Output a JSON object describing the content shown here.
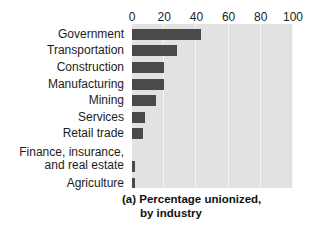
{
  "chart_data": {
    "type": "bar",
    "orientation": "horizontal",
    "title": "(a) Percentage unionized, by industry",
    "title_line1": "(a) Percentage unionized,",
    "title_line2": "by industry",
    "xlabel": "",
    "ylabel": "",
    "xlim": [
      0,
      100
    ],
    "xticks": [
      0,
      20,
      40,
      60,
      80,
      100
    ],
    "xticklabels": [
      "0",
      "20",
      "40",
      "60",
      "80",
      "100"
    ],
    "grid": true,
    "grid_axis": "x",
    "legend": "none",
    "categories": [
      "Government",
      "Transportation",
      "Construction",
      "Manufacturing",
      "Mining",
      "Services",
      "Retail trade",
      "Finance, insurance,\nand real estate",
      "Agriculture"
    ],
    "values": [
      43,
      28,
      20,
      20,
      15,
      8,
      7,
      2,
      1.5
    ],
    "colors": {
      "bar": "#4a4a4a",
      "plot_background": "#e2e2e2",
      "gridline": "#f4f4f4",
      "figure_background": "#ffffff",
      "text": "#1c1c1c"
    }
  },
  "axis": {
    "ticks": [
      {
        "label": "0",
        "value": 0
      },
      {
        "label": "20",
        "value": 20
      },
      {
        "label": "40",
        "value": 40
      },
      {
        "label": "60",
        "value": 60
      },
      {
        "label": "80",
        "value": 80
      },
      {
        "label": "100",
        "value": 100
      }
    ]
  },
  "rows": [
    {
      "label": "Government",
      "value": 43,
      "tall": false
    },
    {
      "label": "Transportation",
      "value": 28,
      "tall": false
    },
    {
      "label": "Construction",
      "value": 20,
      "tall": false
    },
    {
      "label": "Manufacturing",
      "value": 20,
      "tall": false
    },
    {
      "label": "Mining",
      "value": 15,
      "tall": false
    },
    {
      "label": "Services",
      "value": 8,
      "tall": false
    },
    {
      "label": "Retail trade",
      "value": 7,
      "tall": false
    },
    {
      "label": "Finance, insurance,\nand real estate",
      "value": 2,
      "tall": true
    },
    {
      "label": "Agriculture",
      "value": 1.5,
      "tall": false
    }
  ],
  "caption": {
    "line1": "(a) Percentage unionized,",
    "line2": "by industry"
  }
}
